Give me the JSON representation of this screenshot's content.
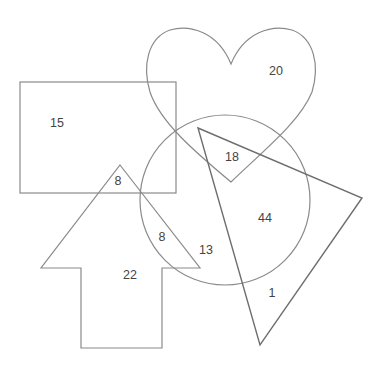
{
  "diagram": {
    "type": "overlapping-shapes-venn",
    "shapes": [
      {
        "name": "rectangle",
        "color": "#8a8a8a"
      },
      {
        "name": "heart",
        "color": "#8a8a8a"
      },
      {
        "name": "circle",
        "color": "#8a8a8a"
      },
      {
        "name": "triangle",
        "color": "#6e6e6e"
      },
      {
        "name": "arrow",
        "color": "#8a8a8a"
      }
    ],
    "labels": [
      {
        "id": "rect-only",
        "text": "15",
        "x": 57,
        "y": 124
      },
      {
        "id": "heart-only",
        "text": "20",
        "x": 276,
        "y": 72
      },
      {
        "id": "heart-circle-triangle",
        "text": "18",
        "x": 232,
        "y": 158
      },
      {
        "id": "rect-arrow",
        "text": "8",
        "x": 118,
        "y": 182
      },
      {
        "id": "circle-arrow",
        "text": "8",
        "x": 162,
        "y": 238
      },
      {
        "id": "circle-only",
        "text": "13",
        "x": 206,
        "y": 251
      },
      {
        "id": "circle-triangle",
        "text": "44",
        "x": 265,
        "y": 219
      },
      {
        "id": "arrow-only",
        "text": "22",
        "x": 130,
        "y": 276
      },
      {
        "id": "triangle-only",
        "text": "1",
        "x": 272,
        "y": 294
      }
    ]
  }
}
